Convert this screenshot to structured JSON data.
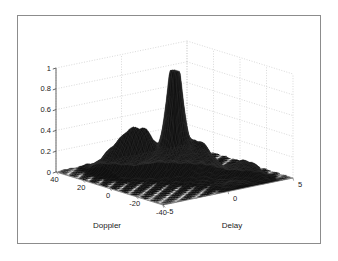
{
  "figure": {
    "type": "surface-plot-3d",
    "background_color": "#ffffff",
    "frame_color": "#8c8c8c",
    "surface_color": "#101010",
    "grid_color": "#c8c8c8",
    "axis_color": "#555555"
  },
  "chart_data": {
    "type": "surface",
    "title": "",
    "subtitle": "",
    "projection": "3d-mesh-surface",
    "xlabel": "Delay",
    "ylabel": "Doppler",
    "zlabel": "",
    "xlim": [
      -5,
      5
    ],
    "ylim": [
      -40,
      40
    ],
    "zlim": [
      0,
      1
    ],
    "xticks": [
      -5,
      0,
      5
    ],
    "xtick_labels": [
      "-5",
      "0",
      "5"
    ],
    "yticks": [
      40,
      20,
      0,
      -20,
      -40
    ],
    "ytick_labels": [
      "40",
      "20",
      "0",
      "-20",
      "-40"
    ],
    "zticks": [
      0,
      0.2,
      0.4,
      0.6,
      0.8,
      1
    ],
    "ztick_labels": [
      "0",
      "0.2",
      "0.4",
      "0.6",
      "0.8",
      "1"
    ],
    "grid": true,
    "grid_style": "dotted",
    "legend": false,
    "legend_position": "none",
    "peak": {
      "delay": 0,
      "doppler": 0,
      "value": 0.92
    },
    "features": [
      {
        "name": "mainlobe",
        "delay": 0.0,
        "doppler": 0,
        "height": 0.92
      },
      {
        "name": "left-ridge-a",
        "delay": -1.9,
        "doppler": 14,
        "height": 0.3
      },
      {
        "name": "left-ridge-b",
        "delay": -1.3,
        "doppler": 8,
        "height": 0.3
      },
      {
        "name": "left-shoulder",
        "delay": -2.6,
        "doppler": 20,
        "height": 0.21
      },
      {
        "name": "right-shoulder",
        "delay": 1.4,
        "doppler": -6,
        "height": 0.26
      },
      {
        "name": "right-sidelobe-a",
        "delay": 2.4,
        "doppler": -24,
        "height": 0.12
      },
      {
        "name": "right-sidelobe-b",
        "delay": 3.1,
        "doppler": -29,
        "height": 0.1
      },
      {
        "name": "front-pedestal",
        "delay": 1.0,
        "doppler": -36,
        "height": 0.04
      }
    ]
  },
  "axes": {
    "z": {
      "ticks": [
        {
          "label": "1",
          "value": 1.0
        },
        {
          "label": "0.8",
          "value": 0.8
        },
        {
          "label": "0.6",
          "value": 0.6
        },
        {
          "label": "0.4",
          "value": 0.4
        },
        {
          "label": "0.2",
          "value": 0.2
        },
        {
          "label": "0",
          "value": 0.0
        }
      ]
    },
    "doppler": {
      "title": "Doppler",
      "ticks": [
        {
          "label": "40",
          "value": 40
        },
        {
          "label": "20",
          "value": 20
        },
        {
          "label": "0",
          "value": 0
        },
        {
          "label": "-20",
          "value": -20
        },
        {
          "label": "-40",
          "value": -40
        }
      ]
    },
    "delay": {
      "title": "Delay",
      "ticks": [
        {
          "label": "-5",
          "value": -5
        },
        {
          "label": "0",
          "value": 0
        },
        {
          "label": "5",
          "value": 5
        }
      ]
    }
  }
}
